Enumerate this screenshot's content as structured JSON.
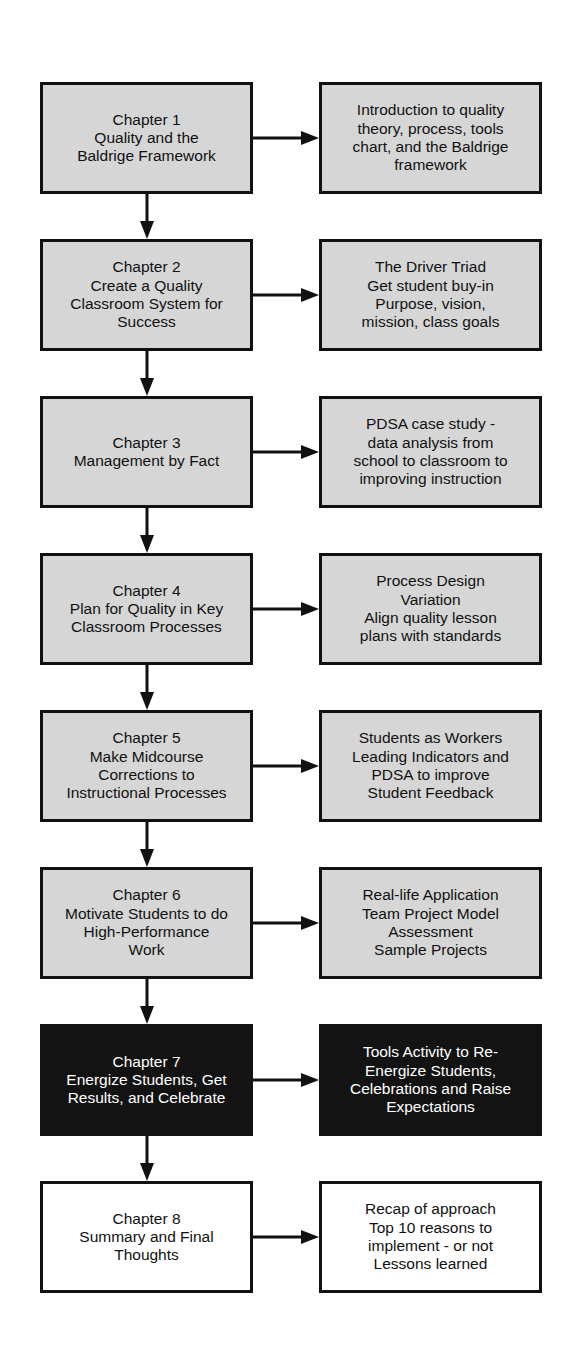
{
  "diagram": {
    "colors": {
      "fill_gray": "#d6d6d6",
      "fill_black": "#131313",
      "fill_white": "#ffffff",
      "stroke": "#111111",
      "text_dark": "#111111",
      "text_light": "#ffffff"
    },
    "rows": [
      {
        "chapter_label": "Chapter 1",
        "chapter_title": "Quality and the\nBaldrige Framework",
        "chapter_text": "Chapter 1\nQuality and the\nBaldrige Framework",
        "description": "Introduction to quality\ntheory, process, tools\nchart, and the Baldrige\nframework",
        "style": "gray",
        "arrow": "right-arrow",
        "connector": "down-arrow"
      },
      {
        "chapter_label": "Chapter 2",
        "chapter_title": "Create a Quality\nClassroom System for\nSuccess",
        "chapter_text": "Chapter 2\nCreate a Quality\nClassroom System for\nSuccess",
        "description": "The Driver Triad\nGet student buy-in\nPurpose, vision,\nmission, class goals",
        "style": "gray",
        "arrow": "right-arrow",
        "connector": "down-arrow"
      },
      {
        "chapter_label": "Chapter 3",
        "chapter_title": "Management by Fact",
        "chapter_text": "Chapter 3\nManagement by Fact",
        "description": "PDSA case study -\ndata analysis from\nschool to classroom to\nimproving instruction",
        "style": "gray",
        "arrow": "right-arrow",
        "connector": "down-arrow"
      },
      {
        "chapter_label": "Chapter 4",
        "chapter_title": "Plan for Quality in Key\nClassroom Processes",
        "chapter_text": "Chapter 4\nPlan for Quality in Key\nClassroom Processes",
        "description": "Process Design\nVariation\nAlign quality lesson\nplans with standards",
        "style": "gray",
        "arrow": "right-arrow",
        "connector": "down-arrow"
      },
      {
        "chapter_label": "Chapter 5",
        "chapter_title": "Make Midcourse\nCorrections to\nInstructional Processes",
        "chapter_text": "Chapter 5\nMake Midcourse\nCorrections to\nInstructional Processes",
        "description": "Students as Workers\nLeading Indicators and\nPDSA to improve\nStudent Feedback",
        "style": "gray",
        "arrow": "right-arrow",
        "connector": "down-arrow"
      },
      {
        "chapter_label": "Chapter 6",
        "chapter_title": "Motivate Students to do\nHigh-Performance\nWork",
        "chapter_text": "Chapter 6\nMotivate Students to do\nHigh-Performance\nWork",
        "description": "Real-life Application\nTeam Project Model\nAssessment\nSample Projects",
        "style": "gray",
        "arrow": "right-arrow",
        "connector": "down-arrow"
      },
      {
        "chapter_label": "Chapter 7",
        "chapter_title": "Energize Students, Get\nResults, and Celebrate",
        "chapter_text": "Chapter 7\nEnergize Students, Get\nResults, and Celebrate",
        "description": "Tools Activity to Re-\nEnergize Students,\nCelebrations and Raise\nExpectations",
        "style": "black",
        "arrow": "right-arrow",
        "connector": "down-arrow"
      },
      {
        "chapter_label": "Chapter 8",
        "chapter_title": "Summary and Final\nThoughts",
        "chapter_text": "Chapter 8\nSummary and Final\nThoughts",
        "description": "Recap of approach\nTop 10 reasons to\nimplement - or not\nLessons learned",
        "style": "white",
        "arrow": "right-arrow",
        "connector": "none"
      }
    ]
  }
}
